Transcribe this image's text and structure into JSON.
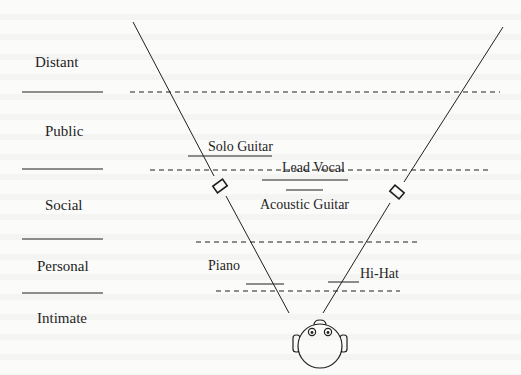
{
  "diagram": {
    "type": "stereo-soundstage-distance-zones",
    "zones": [
      {
        "label": "Distant",
        "label_x": 35,
        "label_y": 67,
        "rule_y": 92
      },
      {
        "label": "Public",
        "label_x": 45,
        "label_y": 136,
        "rule_y": 169
      },
      {
        "label": "Social",
        "label_x": 45,
        "label_y": 210,
        "rule_y": 239
      },
      {
        "label": "Personal",
        "label_x": 37,
        "label_y": 271,
        "rule_y": 293
      },
      {
        "label": "Intimate",
        "label_x": 37,
        "label_y": 323,
        "rule_y": null
      }
    ],
    "instruments": [
      {
        "label": "Solo Guitar",
        "label_x": 208,
        "label_y": 150,
        "line": [
          188,
          156,
          272,
          156
        ]
      },
      {
        "label": "Lead Vocal",
        "label_x": 282,
        "label_y": 170,
        "line": [
          262,
          180,
          348,
          180
        ]
      },
      {
        "label": "Acoustic Guitar",
        "label_x": 260,
        "label_y": 209,
        "line": [
          286,
          190,
          323,
          190
        ]
      },
      {
        "label": "Piano",
        "label_x": 208,
        "label_y": 270,
        "line": [
          246,
          284,
          284,
          284
        ]
      },
      {
        "label": "Hi-Hat",
        "label_x": 360,
        "label_y": 278,
        "line": [
          328,
          282,
          359,
          282
        ]
      }
    ],
    "dashed_lines": [
      {
        "x1": 130,
        "x2": 500,
        "y": 92
      },
      {
        "x1": 150,
        "x2": 488,
        "y": 170
      },
      {
        "x1": 196,
        "x2": 420,
        "y": 242
      },
      {
        "x1": 216,
        "x2": 400,
        "y": 291
      }
    ],
    "speakers": [
      {
        "name": "left-speaker",
        "x": 220,
        "y": 186,
        "angle": 32
      },
      {
        "name": "right-speaker",
        "x": 397,
        "y": 192,
        "angle": -35
      }
    ],
    "listener": {
      "name": "listener-head",
      "cx": 320,
      "cy": 346,
      "r": 22
    },
    "colors": {
      "ink": "#1e1e1e",
      "paper": "#fbfbfa"
    }
  }
}
